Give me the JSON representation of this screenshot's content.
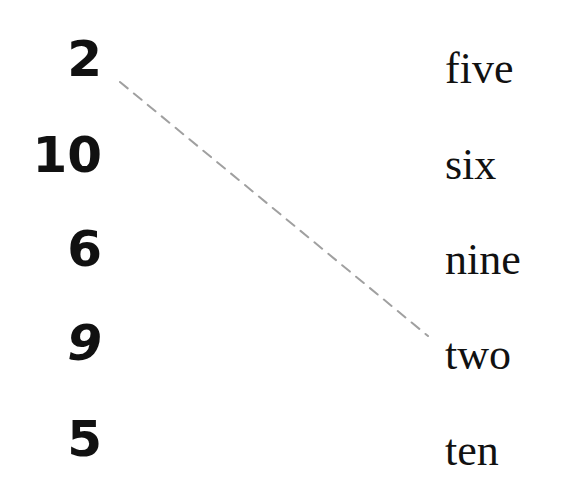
{
  "numbers": [
    "2",
    "10",
    "6",
    "9",
    "5"
  ],
  "words": [
    "five",
    "six",
    "nine",
    "two",
    "ten"
  ],
  "match_line": {
    "from": "2",
    "to": "two",
    "x1": 120,
    "y1": 82,
    "x2": 428,
    "y2": 336,
    "color": "#a0a0a0",
    "style": "dashed"
  }
}
